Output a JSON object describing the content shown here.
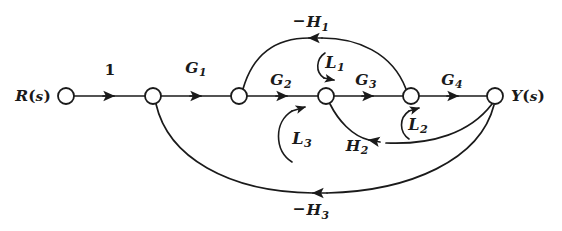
{
  "figure": {
    "kind": "signal-flow-graph",
    "stroke_color": "#1a1a1a",
    "background": "#ffffff",
    "width": 562,
    "height": 231
  },
  "nodes": [
    {
      "id": "n1",
      "label_html": "R<span class=\"paren\">(</span><span class=\"sItal\">s</span><span class=\"paren\">)</span>",
      "label_plain": "R(s)",
      "x": 66,
      "y": 96,
      "r": 8,
      "label_x": 33,
      "label_y": 96
    },
    {
      "id": "n2",
      "label_html": "",
      "label_plain": "",
      "x": 153,
      "y": 96,
      "r": 8
    },
    {
      "id": "n3",
      "label_html": "",
      "label_plain": "",
      "x": 239,
      "y": 96,
      "r": 8
    },
    {
      "id": "n4",
      "label_html": "",
      "label_plain": "",
      "x": 326,
      "y": 96,
      "r": 8
    },
    {
      "id": "n5",
      "label_html": "",
      "label_plain": "",
      "x": 411,
      "y": 96,
      "r": 8
    },
    {
      "id": "n6",
      "label_html": "Y<span class=\"paren\">(</span><span class=\"sItal\">s</span><span class=\"paren\">)</span>",
      "label_plain": "Y(s)",
      "x": 495,
      "y": 96,
      "r": 8,
      "label_x": 528,
      "label_y": 96
    }
  ],
  "branches": [
    {
      "id": "b1",
      "label_plain": "1",
      "label_html": "1",
      "from": "n1",
      "to": "n2",
      "x": 110,
      "y": 70,
      "type": "forward"
    },
    {
      "id": "b2",
      "label_plain": "G1",
      "label_html": "G<span class=\"sub\">1</span>",
      "from": "n2",
      "to": "n3",
      "x": 196,
      "y": 70,
      "type": "forward"
    },
    {
      "id": "b3",
      "label_plain": "G2",
      "label_html": "G<span class=\"sub\">2</span>",
      "from": "n3",
      "to": "n4",
      "x": 281,
      "y": 82,
      "type": "forward"
    },
    {
      "id": "b4",
      "label_plain": "G3",
      "label_html": "G<span class=\"sub\">3</span>",
      "from": "n4",
      "to": "n5",
      "x": 366,
      "y": 82,
      "type": "forward"
    },
    {
      "id": "b5",
      "label_plain": "G4",
      "label_html": "G<span class=\"sub\">4</span>",
      "from": "n5",
      "to": "n6",
      "x": 452,
      "y": 82,
      "type": "forward"
    },
    {
      "id": "b6",
      "label_plain": "-H1",
      "label_html": "<span class=\"minus\">&minus;</span>H<span class=\"sub\">1</span>",
      "from": "n5",
      "to": "n3",
      "x": 311,
      "y": 23,
      "type": "feedback-upper"
    },
    {
      "id": "b7",
      "label_plain": "H2",
      "label_html": "H<span class=\"sub\">2</span>",
      "from": "n6",
      "to": "n4",
      "x": 357,
      "y": 148,
      "type": "feedback-lower"
    },
    {
      "id": "b8",
      "label_plain": "-H3",
      "label_html": "<span class=\"minus\">&minus;</span>H<span class=\"sub\">3</span>",
      "from": "n6",
      "to": "n2",
      "x": 311,
      "y": 211,
      "type": "feedback-outer"
    }
  ],
  "loops": [
    {
      "id": "L1",
      "label_plain": "L1",
      "label_html": "L<span class=\"sub\">1</span>",
      "x": 335,
      "y": 64,
      "direction": "clockwise"
    },
    {
      "id": "L2",
      "label_plain": "L2",
      "label_html": "L<span class=\"sub\">2</span>",
      "x": 418,
      "y": 126,
      "direction": "counterclockwise"
    },
    {
      "id": "L3",
      "label_plain": "L3",
      "label_html": "L<span class=\"sub\">3</span>",
      "x": 302,
      "y": 140,
      "direction": "counterclockwise"
    }
  ]
}
